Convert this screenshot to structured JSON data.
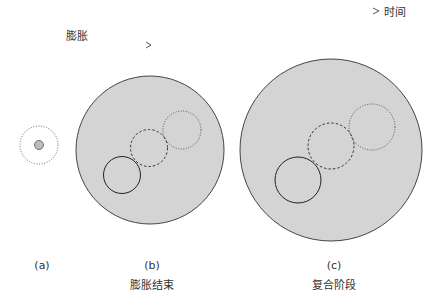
{
  "timeline": {
    "label": "时间",
    "expansion_label": "膨胀"
  },
  "panels": [
    {
      "id": "a",
      "letter": "(a)",
      "caption": ""
    },
    {
      "id": "b",
      "letter": "(b)",
      "caption": "膨胀结束"
    },
    {
      "id": "c",
      "letter": "(c)",
      "caption": "复合阶段"
    }
  ],
  "colors": {
    "fill": "#d4d4d4",
    "stroke": "#333333",
    "small_fill": "#bdbdbd"
  }
}
